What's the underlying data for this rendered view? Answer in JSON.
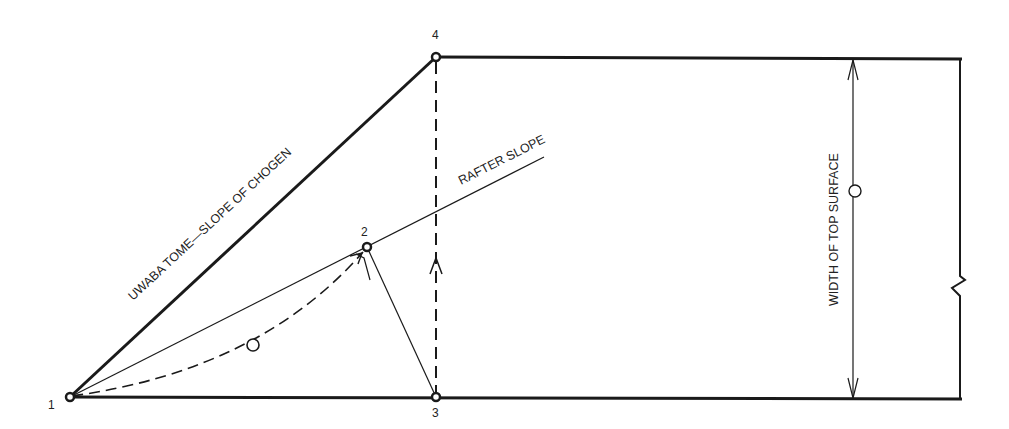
{
  "diagram": {
    "type": "carpentry-layout",
    "colors": {
      "ink": "#1a1a1a",
      "background": "#ffffff"
    },
    "points": [
      {
        "id": "1",
        "label": "1",
        "x": 70,
        "y": 397
      },
      {
        "id": "2",
        "label": "2",
        "x": 367,
        "y": 247
      },
      {
        "id": "3",
        "label": "3",
        "x": 436,
        "y": 397
      },
      {
        "id": "4",
        "label": "4",
        "x": 436,
        "y": 57
      }
    ],
    "labels": {
      "chogen_slope": "UWABA TOME—SLOPE OF CHOGEN",
      "rafter_slope": "RAFTER SLOPE",
      "width_top_surface": "WIDTH OF TOP SURFACE"
    },
    "dimension_markers": {
      "arc_marker": "O",
      "width_marker": "O"
    }
  }
}
